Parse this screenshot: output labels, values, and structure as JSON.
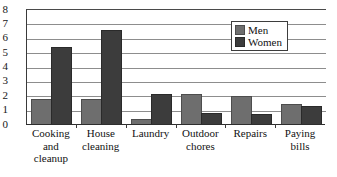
{
  "chart_data": {
    "type": "bar",
    "title": "",
    "subtitle": "",
    "xlabel": "",
    "ylabel": "",
    "ylim": [
      0,
      8
    ],
    "yticks": [
      "0",
      "1",
      "2",
      "3",
      "4",
      "5",
      "6",
      "7",
      "8"
    ],
    "grid": true,
    "legend_position": "top-right",
    "categories": [
      "Cooking and cleanup",
      "House cleaning",
      "Laundry",
      "Outdoor chores",
      "Repairs",
      "Paying bills"
    ],
    "category_label_lines": [
      [
        "Cooking",
        "and",
        "cleanup"
      ],
      [
        "House",
        "cleaning"
      ],
      [
        "Laundry"
      ],
      [
        "Outdoor",
        "chores"
      ],
      [
        "Repairs"
      ],
      [
        "Paying",
        "bills"
      ]
    ],
    "series": [
      {
        "name": "Men",
        "color": "#6e6e6e",
        "values": [
          1.7,
          1.7,
          0.3,
          2.0,
          1.9,
          1.35
        ]
      },
      {
        "name": "Women",
        "color": "#3c3c3c",
        "values": [
          5.3,
          6.5,
          2.0,
          0.7,
          0.6,
          1.15
        ]
      }
    ]
  },
  "legend": {
    "items": [
      {
        "label": "Men"
      },
      {
        "label": "Women"
      }
    ]
  }
}
